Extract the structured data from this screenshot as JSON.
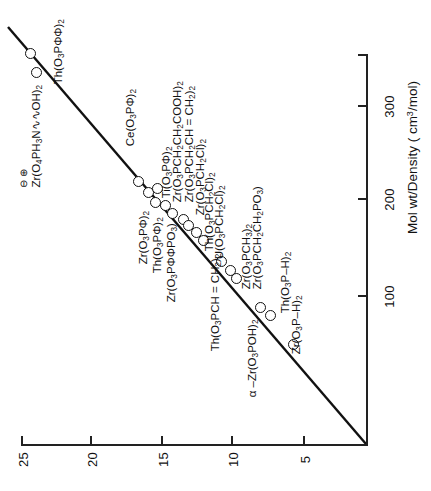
{
  "chart_data": {
    "type": "scatter",
    "title": "",
    "orientation": "rotated-90",
    "xlabel": "Interlayer distance (Å)",
    "ylabel": "Mol wt/Density  ( cm3/mol)",
    "ylabel_display": "Mol wt/Density  ( cm",
    "ylabel_sup": "3",
    "ylabel_tail": "/mol)",
    "x_ticks": [
      25,
      20,
      15,
      10,
      5
    ],
    "y_ticks": [
      300,
      200,
      100
    ],
    "xlim": [
      2,
      26.5
    ],
    "ylim": [
      0,
      370
    ],
    "grid": false,
    "legend": false,
    "series": [
      {
        "name": "metal phosphonates",
        "points": [
          {
            "label": "Zr(O4PH3N∿∿OH)2",
            "x": 24.6,
            "y": 352,
            "charges": "⊖  ⊕"
          },
          {
            "label": "Th(O3PΦΦ)2",
            "x": 23.6,
            "y": 344
          },
          {
            "label": "Ce(O3PΦ)2",
            "x": 15.6,
            "y": 243
          },
          {
            "label": "Zr(O3PΦ)2",
            "x": 15.1,
            "y": 229
          },
          {
            "label": "Th(O3PΦ)2",
            "x": 14.8,
            "y": 222
          },
          {
            "label": "Ti(O3PΦ)2",
            "x": 14.5,
            "y": 226
          },
          {
            "label": "Zr(O3PΦΦPO3)",
            "x": 14.0,
            "y": 214
          },
          {
            "label": "Zr(O3PCH2CH2COOH)2",
            "x": 13.5,
            "y": 206
          },
          {
            "label": "Zr(O3PCH2CH=CH2)2",
            "x": 12.2,
            "y": 196
          },
          {
            "label": "Zr(O3PCH2Cl)2",
            "x": 11.8,
            "y": 190
          },
          {
            "label": "Th(O3PCH2Cl)2",
            "x": 11.0,
            "y": 183
          },
          {
            "label": "U(O3PCH2Cl)2",
            "x": 10.4,
            "y": 176
          },
          {
            "label": "Th(O3PCH=CH2)2",
            "x": 10.2,
            "y": 152
          },
          {
            "label": "Zr(O3PCH3)2",
            "x": 9.6,
            "y": 143
          },
          {
            "label": "Zr(O3PCH2CH2PO3)",
            "x": 9.3,
            "y": 137
          },
          {
            "label": "α–Zr(O3POH)2",
            "x": 7.6,
            "y": 112
          },
          {
            "label": "Th(O3P–H)2",
            "x": 6.9,
            "y": 104
          },
          {
            "label": "Zr(O3P–H)2",
            "x": 5.3,
            "y": 75
          }
        ]
      }
    ],
    "trend_line": {
      "description": "straight best-fit line from lower-left to upper-right of rotated plot"
    }
  },
  "axes": {
    "vertical_axis_name": "mol-wt-density-axis",
    "horizontal_axis_name": "interlayer-distance-axis",
    "title": "Mol wt/Density  ( cm",
    "title_sup": "3",
    "title_tail": "/mol)"
  },
  "ticks": {
    "vertical": [
      {
        "label": "300",
        "top": 99
      },
      {
        "label": "200",
        "top": 192
      },
      {
        "label": "100",
        "top": 289
      }
    ],
    "horizontal": [
      {
        "label": "25",
        "left": 8
      },
      {
        "label": "20",
        "left": 77
      },
      {
        "label": "15",
        "left": 148
      },
      {
        "label": "10",
        "left": 218
      },
      {
        "label": "5",
        "left": 290
      }
    ]
  },
  "points": [
    {
      "id": "zr-o4ph3n-oh-2",
      "label_main": "Zr(O",
      "s1": "4",
      "t1": "PH",
      "s2": "3",
      "t2": "N∿∿OH)",
      "s3": "2",
      "charges": "⊖     ⊕",
      "mx": 36,
      "my": 72,
      "lx": 30,
      "ly": 175
    },
    {
      "id": "th-o3pff-2",
      "label_main": "Th(O",
      "s1": "3",
      "t1": "PΦΦ)",
      "s2": "2",
      "mx": 30,
      "my": 53,
      "lx": 58,
      "ly": 78
    },
    {
      "id": "ce-o3pf-2",
      "label_main": "Ce(O",
      "s1": "3",
      "t1": "PΦ)",
      "s2": "2",
      "mx": 138,
      "my": 181,
      "lx": 130,
      "ly": 140
    },
    {
      "id": "zr-o3pf-2",
      "label_main": "Zr(O",
      "s1": "3",
      "t1": "PΦ)",
      "s2": "2",
      "mx": 148,
      "my": 192,
      "lx": 143,
      "ly": 258
    },
    {
      "id": "th-o3pf-2",
      "label_main": "Th(O",
      "s1": "3",
      "t1": "PΦ)",
      "s2": "2",
      "mx": 155,
      "my": 202,
      "lx": 157,
      "ly": 267
    },
    {
      "id": "ti-o3pf-2",
      "label_main": "Ti(O",
      "s1": "3",
      "t1": "PΦ)",
      "s2": "2",
      "mx": 157,
      "my": 188,
      "lx": 166,
      "ly": 192
    },
    {
      "id": "zr-o3pffpo3",
      "label_main": "Zr(O",
      "s1": "3",
      "t1": "PΦΦPO",
      "s2": "3",
      "t2": ")",
      "mx": 165,
      "my": 205,
      "lx": 171,
      "ly": 296
    },
    {
      "id": "zr-o3pch2ch2cooh-2",
      "label_main": "Zr(O",
      "s1": "3",
      "t1": "PCH",
      "s2": "2",
      "t2": "CH",
      "s3": "2",
      "t3": "COOH)",
      "s4": "2",
      "mx": 172,
      "my": 213,
      "lx": 177,
      "ly": 196
    },
    {
      "id": "zr-o3pch2ch-ch2-2",
      "label_main": "Zr(O",
      "s1": "3",
      "t1": "PCH",
      "s2": "2",
      "t2": "CH = CH",
      "s3": "2",
      "t3": ")",
      "s4": "2",
      "mx": 183,
      "my": 219,
      "lx": 189,
      "ly": 196
    },
    {
      "id": "zr-o3pch2cl-2",
      "label_main": "Zr(O",
      "s1": "3",
      "t1": "PCH",
      "s2": "2",
      "t2": "Cl)",
      "s3": "2",
      "mx": 188,
      "my": 225,
      "lx": 200,
      "ly": 209
    },
    {
      "id": "th-o3pch2cl-2",
      "label_main": "Th(O",
      "s1": "3",
      "t1": "PCH",
      "s2": "2",
      "t2": "Cl)",
      "s3": "2",
      "mx": 196,
      "my": 232,
      "lx": 209,
      "ly": 245
    },
    {
      "id": "u-o3pch2cl-2",
      "label_main": "U(O",
      "s1": "3",
      "t1": "PCH",
      "s2": "2",
      "t2": "Cl)",
      "s3": "2",
      "mx": 203,
      "my": 240,
      "lx": 219,
      "ly": 253
    },
    {
      "id": "th-o3pch-ch2-2",
      "label_main": "Th(O",
      "s1": "3",
      "t1": "PCH = CH",
      "s2": "2",
      "t2": ")",
      "s3": "2",
      "mx": 221,
      "my": 261,
      "lx": 215,
      "ly": 345
    },
    {
      "id": "zr-o3pch3-2",
      "label_main": "Zr(O",
      "s1": "3",
      "t1": "PCH",
      "s2": "3",
      "t2": ")",
      "s3": "2",
      "mx": 230,
      "my": 270,
      "lx": 246,
      "ly": 283
    },
    {
      "id": "zr-o3pch2ch2po3",
      "label_main": "Zr(O",
      "s1": "3",
      "t1": "PCH",
      "s2": "2",
      "t2": "CH",
      "s3": "2",
      "t3": "PO",
      "s4": "3",
      "t4": ")",
      "mx": 236,
      "my": 278,
      "lx": 257,
      "ly": 283
    },
    {
      "id": "alpha-zr-o3poh-2",
      "label_main": "α –Zr(O",
      "s1": "3",
      "t1": "POH)",
      "s2": "2",
      "mx": 260,
      "my": 307,
      "lx": 252,
      "ly": 391
    },
    {
      "id": "th-o3p-h-2",
      "label_main": "Th(O",
      "s1": "3",
      "t1": "P–H)",
      "s2": "2",
      "mx": 270,
      "my": 315,
      "lx": 285,
      "ly": 307
    },
    {
      "id": "zr-o3p-h-2",
      "label_main": "Zr(O",
      "s1": "3",
      "t1": "P–H)",
      "s2": "2",
      "mx": 293,
      "my": 344,
      "lx": 296,
      "ly": 348
    }
  ],
  "trend": {
    "x1": 8,
    "y1": 27,
    "x2": 366,
    "y2": 444
  }
}
